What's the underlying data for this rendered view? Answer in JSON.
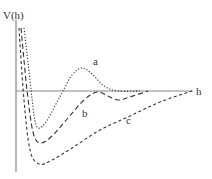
{
  "chart_data": {
    "type": "line",
    "title": "",
    "xlabel": "h",
    "ylabel": "V(h)",
    "grid": false,
    "legend": "inline labels",
    "axis_ranges": {
      "x": [
        0,
        1
      ],
      "y": [
        -1,
        1
      ]
    },
    "series": [
      {
        "name": "a",
        "style": "dotted",
        "description": "Repulsive wall, primary minimum, positive energy barrier, then decays to zero",
        "points": [
          [
            24,
            28
          ],
          [
            30,
            80
          ],
          [
            34,
            115
          ],
          [
            38,
            128
          ],
          [
            46,
            122
          ],
          [
            56,
            104
          ],
          [
            63,
            91
          ],
          [
            72,
            75
          ],
          [
            82,
            68
          ],
          [
            92,
            74
          ],
          [
            104,
            86
          ],
          [
            118,
            91
          ],
          [
            140,
            91
          ]
        ]
      },
      {
        "name": "b",
        "style": "dashed",
        "description": "Primary minimum, small barrier near zero, shallow secondary minimum",
        "points": [
          [
            21,
            28
          ],
          [
            27,
            90
          ],
          [
            33,
            132
          ],
          [
            40,
            143
          ],
          [
            52,
            136
          ],
          [
            68,
            118
          ],
          [
            84,
            100
          ],
          [
            97,
            92
          ],
          [
            108,
            96
          ],
          [
            118,
            100
          ],
          [
            130,
            97
          ],
          [
            148,
            91
          ]
        ]
      },
      {
        "name": "c",
        "style": "short-dashed",
        "description": "Deep attractive minimum, no barrier, monotonic approach to zero",
        "points": [
          [
            19,
            28
          ],
          [
            24,
            100
          ],
          [
            30,
            150
          ],
          [
            39,
            164
          ],
          [
            52,
            160
          ],
          [
            72,
            148
          ],
          [
            100,
            130
          ],
          [
            130,
            116
          ],
          [
            160,
            102
          ],
          [
            192,
            91
          ]
        ]
      }
    ],
    "annotations": [
      "a",
      "b",
      "c"
    ]
  },
  "labels": {
    "y_axis": "V(h)",
    "x_axis": "h",
    "curve_a": "a",
    "curve_b": "b",
    "curve_c": "c"
  },
  "colors": {
    "axis": "#888888",
    "curves": "#333333",
    "background": "#ffffff"
  }
}
